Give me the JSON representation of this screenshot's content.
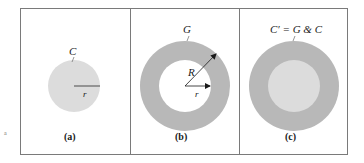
{
  "figure": {
    "colors": {
      "border": "#7a7a7a",
      "fill_light": "#dcdcdc",
      "fill_dark": "#b8b8b8",
      "text": "#1a1a1a",
      "background": "#ffffff"
    },
    "stray_mark": "a",
    "panels": [
      {
        "id": "a",
        "caption": "(a)",
        "shape_label": "C",
        "radius_label": "r",
        "description": "Light gray filled disk of radius r"
      },
      {
        "id": "b",
        "caption": "(b)",
        "shape_label": "G",
        "outer_radius_label": "R",
        "inner_radius_label": "r",
        "description": "Gray annulus with inner radius r and outer radius R"
      },
      {
        "id": "c",
        "caption": "(c)",
        "shape_label": "C′ = G & C",
        "description": "Light disk C overlaid on annulus G, forming a full disk"
      }
    ]
  }
}
